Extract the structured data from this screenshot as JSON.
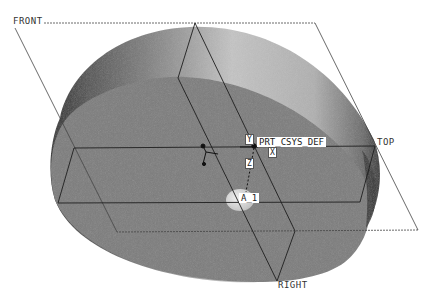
{
  "viewport": {
    "background": "#ffffff",
    "render_mode": "shaded"
  },
  "datum_planes": [
    {
      "name": "FRONT",
      "label": "FRONT"
    },
    {
      "name": "TOP",
      "label": "TOP"
    },
    {
      "name": "RIGHT",
      "label": "RIGHT"
    }
  ],
  "coordinate_system": {
    "label": "PRT_CSYS_DEF",
    "axis_tags": {
      "x": "X",
      "y": "Y",
      "z": "Z"
    }
  },
  "datum_axis": {
    "label": "A_1"
  },
  "colors": {
    "plane_edge": "#3a3a3a",
    "part_top_face": "#7d7d7d",
    "part_side_light": "#b9b9b9",
    "part_side_dark": "#2e2e2e",
    "tag_bg": "#ffffff"
  }
}
